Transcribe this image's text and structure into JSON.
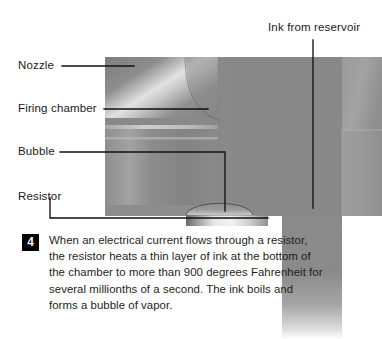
{
  "figure": {
    "step_number": "4",
    "step_text": "When an electrical current flows through a resistor, the resistor heats a thin layer of ink at the bottom of the chamber to more than 900 degrees Fahrenheit for several millionths of a second. The ink boils and forms a bubble of vapor."
  },
  "callouts": [
    {
      "id": "nozzle",
      "label": "Nozzle"
    },
    {
      "id": "firing",
      "label": "Firing chamber"
    },
    {
      "id": "bubble",
      "label": "Bubble"
    },
    {
      "id": "resistor",
      "label": "Resistor"
    },
    {
      "id": "ink",
      "label": "Ink from reservoir"
    }
  ],
  "colors": {
    "background": "#ffffff",
    "text": "#1a1a1a",
    "leader_line": "#111111",
    "badge_bg": "#000000",
    "badge_text": "#ffffff",
    "gray_mid": "#8a8a8a",
    "gray_dark": "#6e6e6e",
    "gray_light": "#b9b9b9",
    "gray_highlight": "#d8d8d8",
    "gray_deep": "#5a5a5a"
  }
}
